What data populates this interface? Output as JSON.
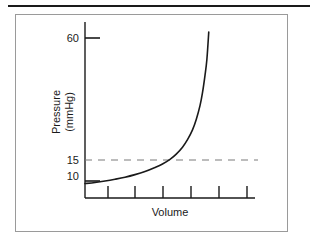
{
  "figure": {
    "caption_rule": "",
    "background_color": "#ffffff",
    "frame_color": "#9a9a9a",
    "ink_color": "#1a1a1a"
  },
  "chart_data": {
    "type": "line",
    "title": "",
    "subtitle": "",
    "xlabel": "Volume",
    "ylabel": "Pressure (mmHg)",
    "ylabel_line1": "Pressure",
    "ylabel_line2": "(mmHg)",
    "x_tick_labels": [
      "",
      "",
      "",
      "",
      "",
      ""
    ],
    "x_tick_count": 6,
    "y_tick_labels": [
      "60",
      "15",
      "10"
    ],
    "y_tick_values": [
      60,
      15,
      10
    ],
    "y_ticks_drawn": [
      "60",
      "10"
    ],
    "grid": false,
    "legend": null,
    "annotations": [
      {
        "name": "reference-line",
        "style": "dashed",
        "y_value": 15,
        "label": "15",
        "color": "#7a7a7a"
      }
    ],
    "series": [
      {
        "name": "pressure-volume-curve",
        "style": "solid",
        "color": "#1a1a1a",
        "description": "Compliance curve: pressure rises slowly then steeply with volume",
        "x": [
          0.0,
          0.08,
          0.16,
          0.24,
          0.32,
          0.4,
          0.48,
          0.56,
          0.62,
          0.68,
          0.73,
          0.78,
          0.82,
          0.86,
          0.89,
          0.92,
          0.94,
          0.96,
          0.975,
          0.99
        ],
        "y": [
          10.0,
          10.4,
          10.9,
          11.5,
          12.2,
          13.1,
          14.2,
          15.6,
          16.8,
          18.4,
          20.2,
          22.6,
          25.2,
          28.6,
          32.2,
          37.0,
          41.5,
          47.5,
          53.0,
          62.5
        ]
      }
    ],
    "xlim": [
      0,
      1
    ],
    "ylim": [
      5,
      66
    ]
  }
}
